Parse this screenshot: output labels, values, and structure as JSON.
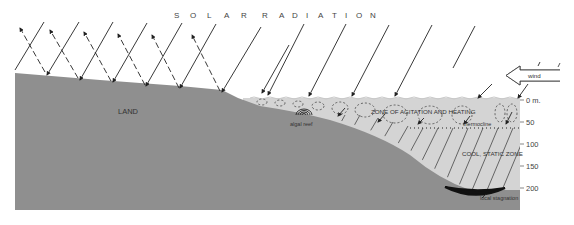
{
  "title": {
    "letters_part1": [
      "S",
      "O",
      "L",
      "A",
      "R"
    ],
    "letters_part2": [
      "R",
      "A",
      "D",
      "I",
      "A",
      "T",
      "I",
      "O",
      "N"
    ]
  },
  "labels": {
    "land": "LAND",
    "algal_reef": "algal reef",
    "zone_agitation": "ZONE OF AGITATION AND HEATING",
    "thermocline": "thermocline",
    "cool_zone": "COOL, STATIC ZONE",
    "local_stagnation": "local stagnation",
    "wind": "wind"
  },
  "depth_axis": {
    "unit": "m.",
    "ticks": [
      {
        "label": "0 m.",
        "y": 100
      },
      {
        "label": "50",
        "y": 122
      },
      {
        "label": "100",
        "y": 144
      },
      {
        "label": "150",
        "y": 166
      },
      {
        "label": "200",
        "y": 188
      }
    ]
  },
  "colors": {
    "land": "#8f8f8f",
    "water": "#d4d4d4",
    "stagnation": "#111111",
    "lines": "#222222",
    "background": "#ffffff"
  },
  "icons": {
    "wind_arrow": "hollow-left-arrow",
    "radiation_arrow": "diagonal-down-left-arrow",
    "reflection_arrow": "dashed-up-left-arrow"
  }
}
